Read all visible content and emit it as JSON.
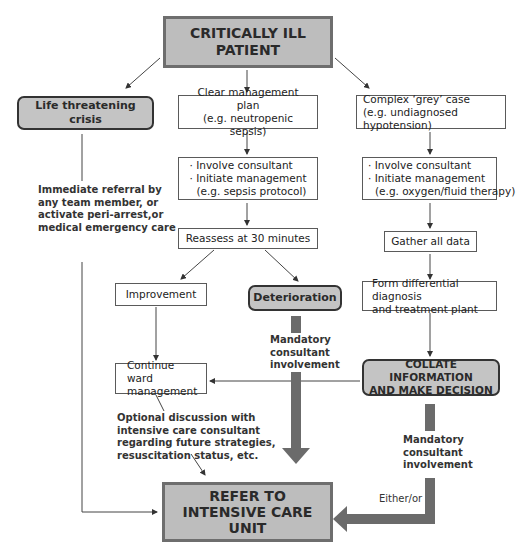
{
  "nodes": {
    "critically_ill": {
      "line1": "CRITICALLY ILL",
      "line2": "PATIENT"
    },
    "life_threatening": {
      "label": "Life threatening crisis"
    },
    "clear_plan": {
      "line1": "Clear management plan",
      "line2": "(e.g. neutropenic sepsis)"
    },
    "complex_case": {
      "line1": "Complex ‘grey’ case",
      "line2": "(e.g. undiagnosed hypotension)"
    },
    "involve_mid": {
      "bullet1": "· Involve consultant",
      "bullet2": "· Initiate management",
      "line3": "(e.g. sepsis protocol)"
    },
    "involve_right": {
      "bullet1": "· Involve consultant",
      "bullet2": "· Initiate management",
      "line3": "(e.g. oxygen/fluid therapy)"
    },
    "reassess": {
      "label": "Reassess at 30 minutes"
    },
    "gather": {
      "label": "Gather all data"
    },
    "improvement": {
      "label": "Improvement"
    },
    "deterioration": {
      "label": "Deterioration"
    },
    "differential": {
      "line1": "Form differential diagnosis",
      "line2": "and treatment plant"
    },
    "continue_ward": {
      "line1": "Continue ward",
      "line2": "management"
    },
    "collate": {
      "line1": "COLLATE INFORMATION",
      "line2": "AND MAKE DECISION"
    },
    "refer_icu": {
      "line1": "REFER TO",
      "line2": "INTENSIVE CARE",
      "line3": "UNIT"
    }
  },
  "annotations": {
    "immediate_referral": [
      "Immediate referral by",
      "any team member, or",
      "activate peri-arrest,or",
      "medical emergency care"
    ],
    "mandatory_mid": [
      "Mandatory",
      "consultant",
      "involvement"
    ],
    "mandatory_right": [
      "Mandatory",
      "consultant",
      "involvement"
    ],
    "optional_discussion": [
      "Optional discussion with",
      "intensive care consultant",
      "regarding future strategies,",
      "resuscitation status, etc."
    ],
    "either_or": "Either/or"
  },
  "colors": {
    "box_fill_grey": "#bdbdbd",
    "box_border_grey": "#6e6e6e",
    "thick_arrow": "#6b6b6b",
    "line": "#444444"
  }
}
